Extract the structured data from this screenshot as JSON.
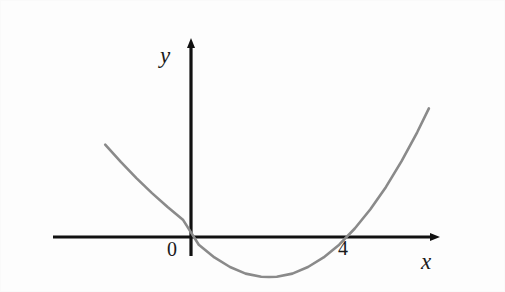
{
  "figure": {
    "kind": "coordinate-plane-parabola-sketch",
    "background_color": "#ffffff",
    "axis_color": "#111111",
    "curve_color": "#8a8a8a"
  },
  "axes": {
    "x_axis_label": "x",
    "y_axis_label": "y",
    "x_axis_arrow": "arrow-right",
    "y_axis_arrow": "arrow-up",
    "origin_label": "0",
    "tick_labels": [
      "0",
      "4"
    ]
  },
  "chart_data": {
    "type": "line",
    "title": "",
    "xlabel": "x",
    "ylabel": "y",
    "grid": false,
    "legend": "none",
    "xlim": [
      -3.5,
      6.3
    ],
    "ylim": [
      -1.6,
      5.2
    ],
    "annotations": [
      {
        "text": "0",
        "x": -0.55,
        "y": -0.35
      },
      {
        "text": "4",
        "x": 3.85,
        "y": -0.35
      },
      {
        "text": "x",
        "x": 6.0,
        "y": -0.55
      },
      {
        "text": "y",
        "x": -0.75,
        "y": 5.0
      }
    ],
    "series": [
      {
        "name": "parabola",
        "equation": "y = 0.26x(x - 4)",
        "color": "#8a8a8a",
        "roots": [
          0,
          4
        ],
        "vertex": [
          2,
          -1.04
        ],
        "x": [
          -2.2,
          -1.8,
          -1.4,
          -1.0,
          -0.6,
          -0.2,
          0.2,
          0.6,
          1.0,
          1.4,
          1.8,
          2.0,
          2.2,
          2.6,
          3.0,
          3.4,
          3.8,
          4.2,
          4.6,
          5.0,
          5.4,
          5.8,
          6.1
        ],
        "values": [
          2.4,
          1.95,
          1.53,
          1.14,
          0.78,
          0.44,
          -0.2,
          -0.53,
          -0.78,
          -0.95,
          -1.03,
          -1.04,
          -1.03,
          -0.95,
          -0.78,
          -0.53,
          -0.2,
          0.22,
          0.72,
          1.3,
          1.97,
          2.72,
          3.34
        ]
      }
    ]
  }
}
